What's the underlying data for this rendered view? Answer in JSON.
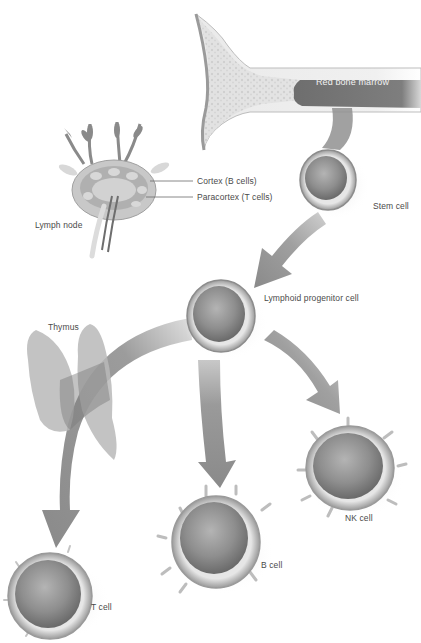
{
  "diagram": {
    "colors": {
      "background": "#ffffff",
      "arrow": "#8c8c8c",
      "arrow_dark": "#6e6e6e",
      "bone": "#e8e8e8",
      "marrow": "#7a7a7a",
      "cell_outer": "#c8c8c8",
      "cell_inner": "#8a8a8a",
      "text": "#4a4a4a"
    },
    "labels": {
      "red_bone_marrow": "Red bone marrow",
      "cortex": "Cortex (B cells)",
      "paracortex": "Paracortex (T cells)",
      "lymph_node": "Lymph node",
      "stem_cell": "Stem cell",
      "lymphoid_progenitor": "Lymphoid progenitor cell",
      "thymus": "Thymus",
      "nk_cell": "NK cell",
      "b_cell": "B cell",
      "t_cell": "T cell"
    },
    "nodes": [
      {
        "id": "bone",
        "label": "Red bone marrow"
      },
      {
        "id": "lymph-node",
        "label": "Lymph node",
        "parts": [
          "Cortex (B cells)",
          "Paracortex (T cells)"
        ]
      },
      {
        "id": "stem-cell",
        "label": "Stem cell"
      },
      {
        "id": "lymphoid-progenitor",
        "label": "Lymphoid progenitor cell"
      },
      {
        "id": "thymus",
        "label": "Thymus"
      },
      {
        "id": "t-cell",
        "label": "T cell"
      },
      {
        "id": "b-cell",
        "label": "B cell"
      },
      {
        "id": "nk-cell",
        "label": "NK cell"
      }
    ],
    "edges": [
      {
        "from": "bone",
        "to": "stem-cell"
      },
      {
        "from": "stem-cell",
        "to": "lymphoid-progenitor"
      },
      {
        "from": "lymphoid-progenitor",
        "to": "t-cell",
        "via": "thymus"
      },
      {
        "from": "lymphoid-progenitor",
        "to": "b-cell"
      },
      {
        "from": "lymphoid-progenitor",
        "to": "nk-cell"
      }
    ]
  }
}
